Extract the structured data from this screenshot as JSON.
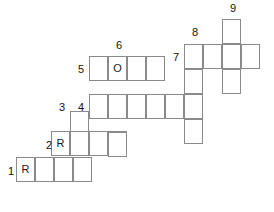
{
  "puzzle": {
    "kind": "crossword-grid",
    "title": "",
    "cell_width": 19,
    "cell_height": 25,
    "origin_x": 16,
    "origin_y": 19,
    "colors": {
      "grid_line": "#8a8a8a",
      "background": "#ffffff",
      "letter": "#1a1a1a",
      "number": "#111111"
    },
    "clue_numbers": [
      {
        "id": "1",
        "label": "1",
        "x": 4,
        "y": 166
      },
      {
        "id": "2",
        "label": "2",
        "x": 42,
        "y": 140
      },
      {
        "id": "3",
        "label": "3",
        "x": 55,
        "y": 102
      },
      {
        "id": "4",
        "label": "4",
        "x": 74,
        "y": 102
      },
      {
        "id": "5",
        "label": "5",
        "x": 74,
        "y": 64
      },
      {
        "id": "6",
        "label": "6",
        "x": 112,
        "y": 40
      },
      {
        "id": "7",
        "label": "7",
        "x": 169,
        "y": 52
      },
      {
        "id": "8",
        "label": "8",
        "x": 188,
        "y": 27
      },
      {
        "id": "9",
        "label": "9",
        "x": 226,
        "y": 3
      }
    ],
    "cells": [
      {
        "name": "cell-r0c11",
        "x": 222,
        "y": 19,
        "letter": ""
      },
      {
        "name": "cell-r1c9",
        "x": 184,
        "y": 44,
        "letter": ""
      },
      {
        "name": "cell-r1c10",
        "x": 203,
        "y": 44,
        "letter": ""
      },
      {
        "name": "cell-r1c11",
        "x": 222,
        "y": 44,
        "letter": ""
      },
      {
        "name": "cell-r1c12",
        "x": 241,
        "y": 44,
        "letter": ""
      },
      {
        "name": "cell-r2c4",
        "x": 89,
        "y": 56,
        "letter": ""
      },
      {
        "name": "cell-r2c5",
        "x": 108,
        "y": 56,
        "letter": "O"
      },
      {
        "name": "cell-r2c6",
        "x": 127,
        "y": 56,
        "letter": ""
      },
      {
        "name": "cell-r2c7",
        "x": 146,
        "y": 56,
        "letter": ""
      },
      {
        "name": "cell-r2c9",
        "x": 184,
        "y": 69,
        "letter": ""
      },
      {
        "name": "cell-r2c11",
        "x": 222,
        "y": 69,
        "letter": ""
      },
      {
        "name": "cell-r3c4",
        "x": 89,
        "y": 94,
        "letter": ""
      },
      {
        "name": "cell-r3c5",
        "x": 108,
        "y": 94,
        "letter": ""
      },
      {
        "name": "cell-r3c6",
        "x": 127,
        "y": 94,
        "letter": ""
      },
      {
        "name": "cell-r3c7",
        "x": 146,
        "y": 94,
        "letter": ""
      },
      {
        "name": "cell-r3c8",
        "x": 165,
        "y": 94,
        "letter": ""
      },
      {
        "name": "cell-r3c9",
        "x": 184,
        "y": 94,
        "letter": ""
      },
      {
        "name": "cell-r3c3",
        "x": 70,
        "y": 111,
        "letter": ""
      },
      {
        "name": "cell-r4c2",
        "x": 51,
        "y": 131,
        "letter": "R"
      },
      {
        "name": "cell-r4c3",
        "x": 70,
        "y": 131,
        "letter": ""
      },
      {
        "name": "cell-r4c4",
        "x": 89,
        "y": 131,
        "letter": ""
      },
      {
        "name": "cell-r4c5",
        "x": 108,
        "y": 131,
        "letter": ""
      },
      {
        "name": "cell-r4c9",
        "x": 184,
        "y": 119,
        "letter": ""
      },
      {
        "name": "cell-r5c0",
        "x": 16,
        "y": 157,
        "letter": "R"
      },
      {
        "name": "cell-r5c1",
        "x": 35,
        "y": 157,
        "letter": ""
      },
      {
        "name": "cell-r5c2",
        "x": 54,
        "y": 157,
        "letter": ""
      },
      {
        "name": "cell-r5c3",
        "x": 73,
        "y": 157,
        "letter": ""
      },
      {
        "name": "cell-r5c5b",
        "x": 108,
        "y": 132,
        "letter": ""
      }
    ]
  }
}
